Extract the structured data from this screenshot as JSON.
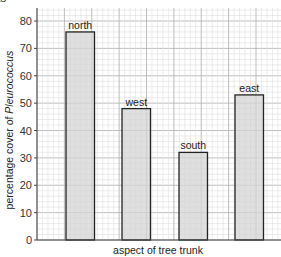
{
  "chart_data": {
    "type": "bar",
    "title": "",
    "categories": [
      "north",
      "west",
      "south",
      "east"
    ],
    "values": [
      76,
      48,
      32,
      53
    ],
    "xlabel": "aspect of tree trunk",
    "ylabel_prefix": "percentage cover of ",
    "ylabel_italic": "Pleurococcus",
    "ylabel": "percentage cover of Pleurococcus",
    "ylim": [
      0,
      85
    ],
    "yticks": [
      0,
      10,
      20,
      30,
      40,
      50,
      60,
      70,
      80
    ],
    "grid": true,
    "legend": null,
    "bar_labels_above": true
  },
  "colors": {
    "bar_fill": "#d4d4d4",
    "bar_stroke": "#222222",
    "grid_major": "#b5b5b5",
    "grid_minor": "#dedede",
    "axis": "#444444"
  },
  "top_clipped_text": "ts"
}
